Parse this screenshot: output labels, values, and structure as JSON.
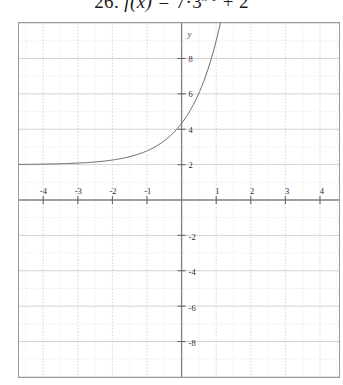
{
  "title": {
    "number": "26.",
    "function_name": "f",
    "variable": "(x)",
    "equals": "=",
    "coefficient": "7·3",
    "exponent": "x-1",
    "constant": "+ 2",
    "full_text": "26. f(x) = 7·3^(x-1) + 2"
  },
  "chart_data": {
    "type": "line",
    "xlabel": "x",
    "ylabel": "y",
    "xlim": [
      -4.7,
      4.55
    ],
    "ylim": [
      -10.0,
      10.0
    ],
    "grid": true,
    "grid_major_step_x": 1,
    "grid_major_step_y": 2,
    "grid_minor_step_x": 0.5,
    "grid_minor_step_y": 1,
    "legend": "none",
    "axis_color": "#808080",
    "grid_major_color": "#c8c8c8",
    "grid_minor_color": "#d8d8d8",
    "curve_color": "#6b6b6b",
    "x_ticks": [
      -4,
      -3,
      -2,
      -1,
      1,
      2,
      3,
      4
    ],
    "x_tick_labels": [
      "-4",
      "-3",
      "-2",
      "-1",
      "1",
      "2",
      "3",
      "4"
    ],
    "y_ticks": [
      8,
      6,
      4,
      2,
      -2,
      -4,
      -6,
      -8
    ],
    "y_tick_labels": [
      "8",
      "6",
      "4",
      "2",
      "-2",
      "-4",
      "-6",
      "-8"
    ],
    "y_axis_label": "y",
    "asymptote": 2,
    "y_intercept": 2.33,
    "series": [
      {
        "name": "f(x) = 7·3^(x-1) + 2",
        "x": [
          -4.7,
          -4.4,
          -4.1,
          -3.8,
          -3.5,
          -3.2,
          -2.9,
          -2.6,
          -2.3,
          -2.0,
          -1.7,
          -1.4,
          -1.1,
          -0.8,
          -0.5,
          -0.2,
          0.0,
          0.2,
          0.4,
          0.6,
          0.8,
          1.0,
          1.2,
          1.4,
          1.6,
          1.8,
          1.9
        ],
        "y": [
          2.01,
          2.02,
          2.02,
          2.03,
          2.04,
          2.05,
          2.07,
          2.09,
          2.12,
          2.26,
          2.21,
          2.29,
          2.41,
          2.57,
          2.78,
          3.06,
          3.33,
          3.68,
          4.14,
          4.73,
          5.5,
          9.0,
          11.5,
          15.0,
          19.8,
          26.1,
          30.0
        ],
        "asymptote": 2,
        "style": "solid-thin"
      }
    ]
  },
  "axes": {
    "y_axis_label": "y"
  }
}
